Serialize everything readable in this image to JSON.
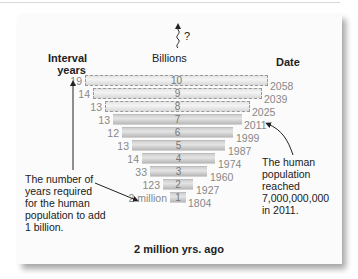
{
  "header": {
    "interval_label": "Interval years",
    "interval_line1": "Interval",
    "interval_line2": "years",
    "billions_label": "Billions",
    "future_mark": "?",
    "date_label": "Date"
  },
  "bars": [
    {
      "billions": "10",
      "interval": "19",
      "date": "2058",
      "projected": true
    },
    {
      "billions": "9",
      "interval": "14",
      "date": "2039",
      "projected": true
    },
    {
      "billions": "8",
      "interval": "13",
      "date": "2025",
      "projected": true
    },
    {
      "billions": "7",
      "interval": "13",
      "date": "2011",
      "projected": false
    },
    {
      "billions": "6",
      "interval": "12",
      "date": "1999",
      "projected": false
    },
    {
      "billions": "5",
      "interval": "13",
      "date": "1987",
      "projected": false
    },
    {
      "billions": "4",
      "interval": "14",
      "date": "1974",
      "projected": false
    },
    {
      "billions": "3",
      "interval": "33",
      "date": "1960",
      "projected": false
    },
    {
      "billions": "2",
      "interval": "123",
      "date": "1927",
      "projected": false
    },
    {
      "billions": "1",
      "interval": "2 million",
      "date": "1804",
      "projected": false
    }
  ],
  "annotations": {
    "left_note": [
      "The number of",
      "years required",
      "for the human",
      "population to add",
      "1 billion."
    ],
    "right_note": [
      "The human",
      "population",
      "reached",
      "7,000,000,000",
      "in 2011."
    ]
  },
  "footer": {
    "baseline_label": "2 million yrs. ago"
  },
  "colors": {
    "text_dark": "#1a1a1a",
    "text_gray": "#888888",
    "bar_fill": "#c8c8c8",
    "panel": "#fbfbfb"
  }
}
